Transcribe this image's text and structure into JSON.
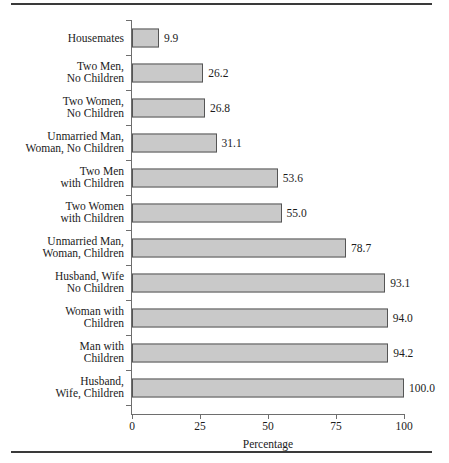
{
  "chart_data": {
    "type": "bar",
    "orientation": "horizontal",
    "title": "",
    "xlabel": "Percentage",
    "ylabel": "",
    "xlim": [
      0,
      100
    ],
    "xticks": [
      0,
      25,
      50,
      75,
      100
    ],
    "xtick_labels": [
      "0",
      "25",
      "50",
      "75",
      "100"
    ],
    "grid": false,
    "legend": null,
    "bar_color": "#c9c9c9",
    "bar_edge_color": "#555555",
    "categories": [
      "Housemates",
      "Two Men,\nNo Children",
      "Two Women,\nNo Children",
      "Unmarried Man,\nWoman, No Children",
      "Two Men\nwith Children",
      "Two Women\nwith Children",
      "Unmarried Man,\nWoman, Children",
      "Husband, Wife\nNo Children",
      "Woman with\nChildren",
      "Man with\nChildren",
      "Husband,\nWife, Children"
    ],
    "values": [
      9.9,
      26.2,
      26.8,
      31.1,
      53.6,
      55.0,
      78.7,
      93.1,
      94.0,
      94.2,
      100.0
    ],
    "value_labels": [
      "9.9",
      "26.2",
      "26.8",
      "31.1",
      "53.6",
      "55.0",
      "78.7",
      "93.1",
      "94.0",
      "94.2",
      "100.0"
    ]
  }
}
